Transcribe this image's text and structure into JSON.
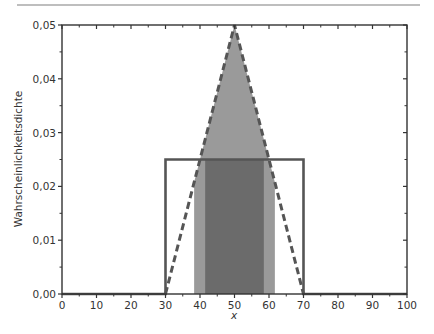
{
  "chart_data": {
    "type": "area",
    "title": "",
    "xlabel": "x",
    "ylabel": "Wahrscheinlichkeitsdichte",
    "xlim": [
      0,
      100
    ],
    "ylim": [
      0,
      0.05
    ],
    "x_ticks": [
      "0",
      "10",
      "20",
      "30",
      "40",
      "50",
      "60",
      "70",
      "80",
      "90",
      "100"
    ],
    "x_tick_values": [
      0,
      10,
      20,
      30,
      40,
      50,
      60,
      70,
      80,
      90,
      100
    ],
    "y_ticks": [
      "0,00",
      "0,01",
      "0,02",
      "0,03",
      "0,04",
      "0,05"
    ],
    "y_tick_values": [
      0,
      0.01,
      0.02,
      0.03,
      0.04,
      0.05
    ],
    "grid": false,
    "legend": null,
    "series": [
      {
        "name": "Gleichverteilung (Rechteck)",
        "style": "solid",
        "color": "#555555",
        "x": [
          0,
          30,
          30,
          70,
          70,
          100
        ],
        "y": [
          0,
          0,
          0.025,
          0.025,
          0,
          0
        ]
      },
      {
        "name": "Dreiecksverteilung",
        "style": "dashed",
        "color": "#555555",
        "x": [
          30,
          50,
          70
        ],
        "y": [
          0,
          0.05,
          0
        ]
      }
    ],
    "shaded_regions": [
      {
        "name": "Dreieck-Intervall",
        "under": "Dreiecksverteilung",
        "x_from": 38.3,
        "x_to": 61.7,
        "color": "#9a9a9a"
      },
      {
        "name": "Rechteck-Intervall",
        "under": "Gleichverteilung (Rechteck)",
        "x_from": 41.5,
        "x_to": 58.5,
        "color": "#6b6b6b"
      }
    ]
  },
  "header_rule_color": "#a0a0a0"
}
